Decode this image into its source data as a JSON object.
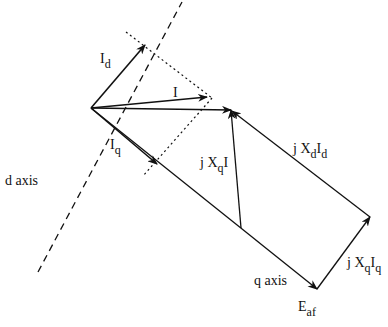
{
  "labels": {
    "Id": {
      "main": "I",
      "sub": "d"
    },
    "I": {
      "main": "I"
    },
    "Iq": {
      "main": "I",
      "sub": "q"
    },
    "d_axis": "d axis",
    "q_axis": "q axis",
    "jXqI": {
      "pre": "j X",
      "sub": "q",
      "post": "I"
    },
    "jXdId": {
      "pre": "j X",
      "sub1": "d",
      "mid": "I",
      "sub2": "d"
    },
    "jXqIq": {
      "pre": "j X",
      "sub1": "q",
      "mid": "I",
      "sub2": "q"
    },
    "Eaf": {
      "main": "E",
      "sub": "af"
    }
  },
  "colors": {
    "line": "#111111",
    "background": "#ffffff"
  }
}
